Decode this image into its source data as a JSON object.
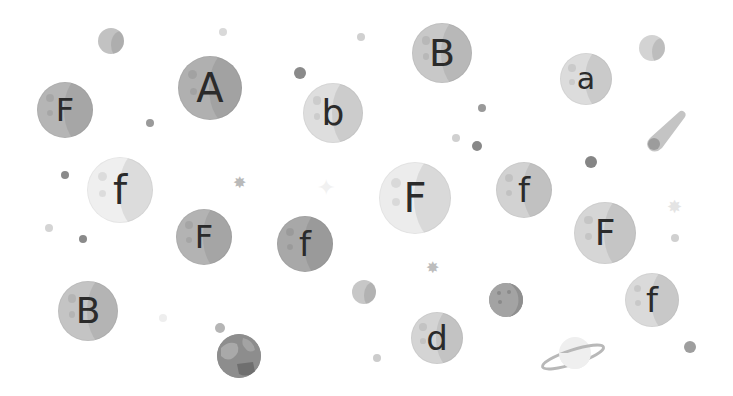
{
  "scene": {
    "background": "#ffffff",
    "bubbles": [
      {
        "letter": "F",
        "cx": 65,
        "cy": 110,
        "r": 28,
        "fill": "#b5b5b5",
        "font": 32
      },
      {
        "letter": "A",
        "cx": 210,
        "cy": 88,
        "r": 32,
        "fill": "#b0b0b0",
        "font": 40
      },
      {
        "letter": "b",
        "cx": 333,
        "cy": 113,
        "r": 30,
        "fill": "#dedede",
        "font": 36
      },
      {
        "letter": "B",
        "cx": 442,
        "cy": 53,
        "r": 30,
        "fill": "#c8c8c8",
        "font": 38
      },
      {
        "letter": "a",
        "cx": 586,
        "cy": 79,
        "r": 26,
        "fill": "#dcdcdc",
        "font": 30
      },
      {
        "letter": "f",
        "cx": 120,
        "cy": 190,
        "r": 33,
        "fill": "#efefef",
        "font": 40
      },
      {
        "letter": "F",
        "cx": 204,
        "cy": 237,
        "r": 28,
        "fill": "#b3b3b3",
        "font": 32
      },
      {
        "letter": "f",
        "cx": 305,
        "cy": 244,
        "r": 28,
        "fill": "#a8a8a8",
        "font": 34
      },
      {
        "letter": "F",
        "cx": 415,
        "cy": 198,
        "r": 36,
        "fill": "#ececec",
        "font": 40
      },
      {
        "letter": "f",
        "cx": 524,
        "cy": 190,
        "r": 28,
        "fill": "#d2d2d2",
        "font": 34
      },
      {
        "letter": "F",
        "cx": 605,
        "cy": 233,
        "r": 31,
        "fill": "#d6d6d6",
        "font": 36
      },
      {
        "letter": "B",
        "cx": 88,
        "cy": 311,
        "r": 30,
        "fill": "#c4c4c4",
        "font": 36
      },
      {
        "letter": "d",
        "cx": 437,
        "cy": 338,
        "r": 26,
        "fill": "#d4d4d4",
        "font": 34
      },
      {
        "letter": "f",
        "cx": 652,
        "cy": 300,
        "r": 27,
        "fill": "#dadada",
        "font": 34
      }
    ],
    "dots": [
      {
        "cx": 223,
        "cy": 32,
        "r": 4,
        "fill": "#d9d9d9"
      },
      {
        "cx": 150,
        "cy": 123,
        "r": 4,
        "fill": "#9a9a9a"
      },
      {
        "cx": 300,
        "cy": 73,
        "r": 6,
        "fill": "#8a8a8a"
      },
      {
        "cx": 361,
        "cy": 37,
        "r": 4,
        "fill": "#d0d0d0"
      },
      {
        "cx": 482,
        "cy": 108,
        "r": 4,
        "fill": "#999999"
      },
      {
        "cx": 456,
        "cy": 138,
        "r": 4,
        "fill": "#d0d0d0"
      },
      {
        "cx": 477,
        "cy": 146,
        "r": 5,
        "fill": "#888888"
      },
      {
        "cx": 591,
        "cy": 162,
        "r": 6,
        "fill": "#858585"
      },
      {
        "cx": 65,
        "cy": 175,
        "r": 4,
        "fill": "#8a8a8a"
      },
      {
        "cx": 49,
        "cy": 228,
        "r": 4,
        "fill": "#d4d4d4"
      },
      {
        "cx": 83,
        "cy": 239,
        "r": 4,
        "fill": "#8a8a8a"
      },
      {
        "cx": 675,
        "cy": 238,
        "r": 4,
        "fill": "#d0d0d0"
      },
      {
        "cx": 163,
        "cy": 318,
        "r": 4,
        "fill": "#eeeeee"
      },
      {
        "cx": 220,
        "cy": 328,
        "r": 5,
        "fill": "#b5b5b5"
      },
      {
        "cx": 377,
        "cy": 358,
        "r": 4,
        "fill": "#cccccc"
      },
      {
        "cx": 690,
        "cy": 347,
        "r": 6,
        "fill": "#9e9e9e"
      }
    ],
    "stars": [
      {
        "glyph": "✸",
        "x": 241,
        "y": 183,
        "size": 16,
        "color": "#b9b9b9"
      },
      {
        "glyph": "✦",
        "x": 328,
        "y": 188,
        "size": 22,
        "color": "#f1f1f1"
      },
      {
        "glyph": "✸",
        "x": 434,
        "y": 268,
        "size": 16,
        "color": "#bdbdbd"
      },
      {
        "glyph": "✸",
        "x": 676,
        "y": 207,
        "size": 18,
        "color": "#e4e4e4"
      }
    ],
    "planets": [
      {
        "name": "small-moon",
        "cx": 111,
        "cy": 41,
        "r": 13,
        "fill": "#c2c2c2"
      },
      {
        "name": "small-moon-right",
        "cx": 652,
        "cy": 48,
        "r": 13,
        "fill": "#d3d3d3"
      },
      {
        "name": "gray-planet",
        "cx": 364,
        "cy": 292,
        "r": 12,
        "fill": "#c7c7c7"
      },
      {
        "name": "cratered-planet",
        "cx": 506,
        "cy": 300,
        "r": 17,
        "fill": "#9f9f9f"
      },
      {
        "name": "earth-planet",
        "cx": 239,
        "cy": 356,
        "r": 22,
        "fill": "#8d8d8d"
      }
    ],
    "comet": {
      "x": 642,
      "y": 108,
      "color": "#c4c4c4",
      "head": "#9c9c9c"
    },
    "saturn": {
      "cx": 573,
      "cy": 355,
      "fill": "#efefef",
      "ring": "#b8b8b8"
    }
  }
}
